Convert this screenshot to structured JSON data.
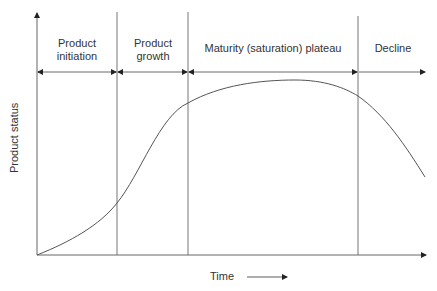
{
  "diagram": {
    "y_axis_label": "Product status",
    "x_axis_label": "Time",
    "phases": [
      {
        "line1": "Product",
        "line2": "initiation"
      },
      {
        "line1": "Product",
        "line2": "growth"
      },
      {
        "line1": "Maturity (saturation) plateau",
        "line2": ""
      },
      {
        "line1": "Decline",
        "line2": ""
      }
    ],
    "colors": {
      "line": "#555555",
      "axis": "#555555",
      "text": "#333333"
    }
  }
}
